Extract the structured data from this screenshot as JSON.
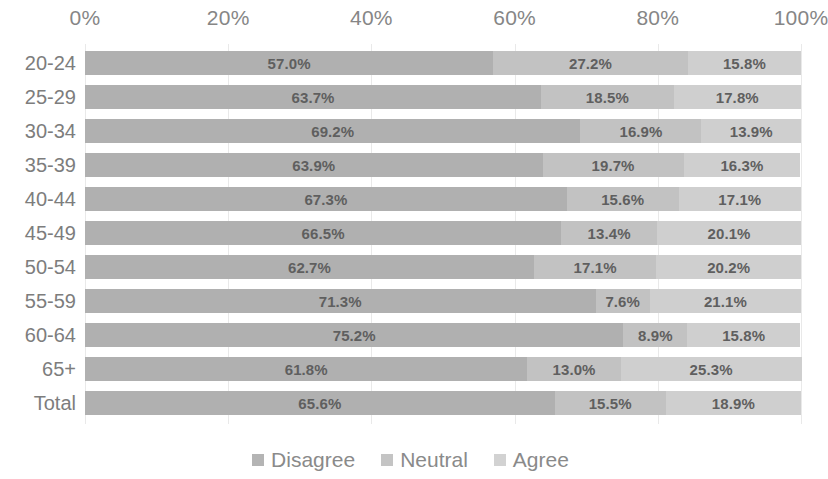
{
  "chart_data": {
    "type": "bar",
    "subtype": "stacked-horizontal-100pct",
    "title": "",
    "xlabel": "",
    "ylabel": "",
    "xlim": [
      0,
      100
    ],
    "grid": true,
    "legend_position": "bottom",
    "x_ticks": [
      "0%",
      "20%",
      "40%",
      "60%",
      "80%",
      "100%"
    ],
    "x_tick_values": [
      0,
      20,
      40,
      60,
      80,
      100
    ],
    "categories": [
      "20-24",
      "25-29",
      "30-34",
      "35-39",
      "40-44",
      "45-49",
      "50-54",
      "55-59",
      "60-64",
      "65+",
      "Total"
    ],
    "series": [
      {
        "name": "Disagree",
        "color": "#b0b0b0",
        "values": [
          57.0,
          63.7,
          69.2,
          63.9,
          67.3,
          66.5,
          62.7,
          71.3,
          75.2,
          61.8,
          65.6
        ],
        "labels": [
          "57.0%",
          "63.7%",
          "69.2%",
          "63.9%",
          "67.3%",
          "66.5%",
          "62.7%",
          "71.3%",
          "75.2%",
          "61.8%",
          "65.6%"
        ]
      },
      {
        "name": "Neutral",
        "color": "#c2c2c2",
        "values": [
          27.2,
          18.5,
          16.9,
          19.7,
          15.6,
          13.4,
          17.1,
          7.6,
          8.9,
          13.0,
          15.5
        ],
        "labels": [
          "27.2%",
          "18.5%",
          "16.9%",
          "19.7%",
          "15.6%",
          "13.4%",
          "17.1%",
          "7.6%",
          "8.9%",
          "13.0%",
          "15.5%"
        ]
      },
      {
        "name": "Agree",
        "color": "#cfcfcf",
        "values": [
          15.8,
          17.8,
          13.9,
          16.3,
          17.1,
          20.1,
          20.2,
          21.1,
          15.8,
          25.3,
          18.9
        ],
        "labels": [
          "15.8%",
          "17.8%",
          "13.9%",
          "16.3%",
          "17.1%",
          "20.1%",
          "20.2%",
          "21.1%",
          "15.8%",
          "25.3%",
          "18.9%"
        ]
      }
    ]
  },
  "legend": {
    "items": [
      {
        "label": "Disagree",
        "color": "#b4b4b4"
      },
      {
        "label": "Neutral",
        "color": "#c4c4c4"
      },
      {
        "label": "Agree",
        "color": "#d2d2d2"
      }
    ]
  }
}
